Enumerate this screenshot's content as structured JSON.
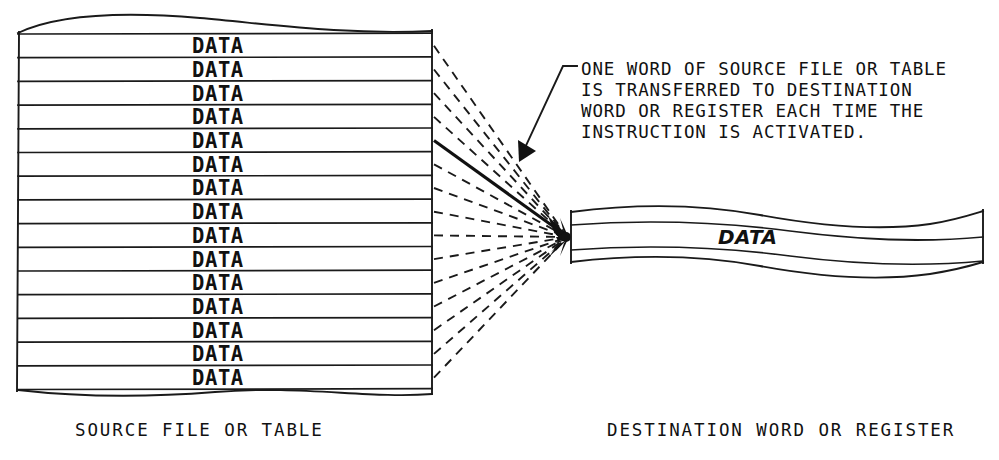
{
  "diagram": {
    "background_color": "#ffffff",
    "ink_color": "#111111",
    "source": {
      "caption": "SOURCE FILE OR TABLE",
      "row_label": "DATA",
      "row_count": 15,
      "rows": [
        "DATA",
        "DATA",
        "DATA",
        "DATA",
        "DATA",
        "DATA",
        "DATA",
        "DATA",
        "DATA",
        "DATA",
        "DATA",
        "DATA",
        "DATA",
        "DATA",
        "DATA"
      ],
      "geometry": {
        "left_x": 18,
        "right_x": 432,
        "first_row_top_y": 34,
        "row_height": 23.7,
        "torn_top_y": 20,
        "torn_bottom_y": 401
      }
    },
    "destination": {
      "caption": "DESTINATION WORD OR REGISTER",
      "row_label": "DATA",
      "row_count": 1,
      "geometry": {
        "left_x": 570,
        "right_x": 983,
        "row_top_y": 225,
        "row_bottom_y": 250
      }
    },
    "annotation": {
      "lines": [
        "ONE WORD OF SOURCE FILE OR TABLE",
        "IS TRANSFERRED TO DESTINATION",
        "WORD OR REGISTER EACH TIME THE",
        "INSTRUCTION IS ACTIVATED."
      ],
      "text_x": 581,
      "first_line_y": 75,
      "line_height": 21
    },
    "transfer_lines": {
      "count": 15,
      "style_dashed": "dashed",
      "style_highlight": "solid",
      "highlighted_index": 5,
      "converge_x": 570,
      "converge_y": 237,
      "description": "One word of source is transferred to destination each scan"
    },
    "leader": {
      "hook_x": 575,
      "hook_y": 67,
      "bend_x": 562,
      "bend_y": 72,
      "arrow_tip_x": 521,
      "arrow_tip_y": 157,
      "description": "leader from note text to highlighted transfer line"
    },
    "captions": {
      "source_caption_x": 75,
      "source_caption_y": 436,
      "destination_caption_x": 607,
      "destination_caption_y": 436
    }
  }
}
